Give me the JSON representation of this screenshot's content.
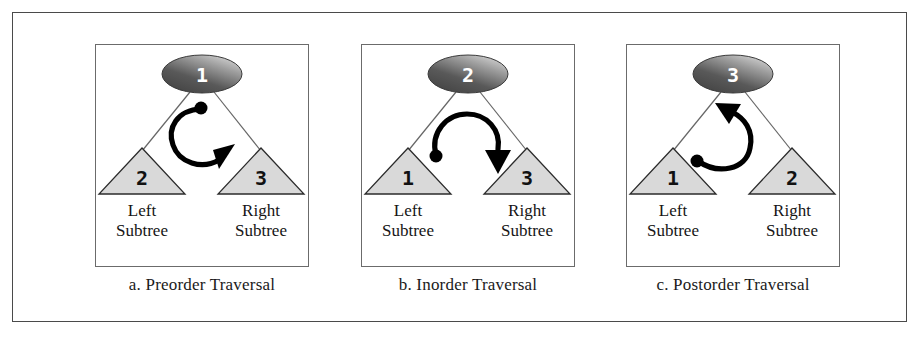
{
  "figure": {
    "background_color": "#ffffff",
    "frame_color": "#4a4a4a",
    "node_fill_dark": "#4c4c4c",
    "node_fill_light": "#b9b9b9",
    "triangle_fill": "#d9d9d9",
    "triangle_stroke": "#2b2b2b",
    "arrow_color": "#000000",
    "edge_color": "#555555"
  },
  "panels": [
    {
      "id": "preorder",
      "caption": "a. Preorder Traversal",
      "root_number": "1",
      "left_number": "2",
      "right_number": "3",
      "left_label_line1": "Left",
      "left_label_line2": "Subtree",
      "right_label_line1": "Right",
      "right_label_line2": "Subtree",
      "arrow_description": "root-then-left-then-right"
    },
    {
      "id": "inorder",
      "caption": "b. Inorder Traversal",
      "root_number": "2",
      "left_number": "1",
      "right_number": "3",
      "left_label_line1": "Left",
      "left_label_line2": "Subtree",
      "right_label_line1": "Right",
      "right_label_line2": "Subtree",
      "arrow_description": "left-then-root-then-right"
    },
    {
      "id": "postorder",
      "caption": "c. Postorder Traversal",
      "root_number": "3",
      "left_number": "1",
      "right_number": "2",
      "left_label_line1": "Left",
      "left_label_line2": "Subtree",
      "right_label_line1": "Right",
      "right_label_line2": "Subtree",
      "arrow_description": "left-then-right-then-root"
    }
  ]
}
